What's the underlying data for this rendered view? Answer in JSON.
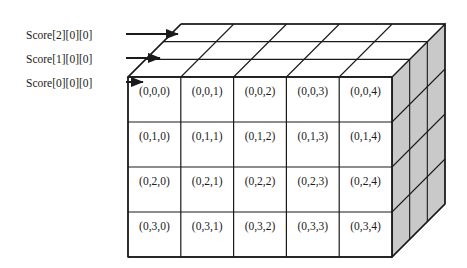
{
  "figure": {
    "colors": {
      "line": "#1a1a1a",
      "side_face_fill": "#c9c9c9",
      "top_face_fill": "#ffffff",
      "front_face_fill": "#ffffff",
      "text": "#1a1a1a",
      "background": "#ffffff"
    },
    "annotations": [
      {
        "id": "score2",
        "text": "Score[2][0][0]",
        "x": 26,
        "y": 29,
        "arrow": {
          "x1": 126,
          "y1": 34,
          "x2": 178,
          "y2": 34
        }
      },
      {
        "id": "score1",
        "text": "Score[1][0][0]",
        "x": 26,
        "y": 53,
        "arrow": {
          "x1": 126,
          "y1": 58,
          "x2": 160,
          "y2": 58
        }
      },
      {
        "id": "score0",
        "text": "Score[0][0][0]",
        "x": 26,
        "y": 77,
        "arrow": {
          "x1": 126,
          "y1": 82,
          "x2": 143,
          "y2": 82
        }
      }
    ],
    "geometry": {
      "front": {
        "left": 128,
        "top": 77,
        "width": 264,
        "height": 180,
        "cols": 5,
        "rows": 4
      },
      "depth": {
        "dx": 53,
        "dy": -53,
        "layers": 3
      }
    },
    "front_cells": [
      [
        "(0,0,0)",
        "(0,0,1)",
        "(0,0,2)",
        "(0,0,3)",
        "(0,0,4)"
      ],
      [
        "(0,1,0)",
        "(0,1,1)",
        "(0,1,2)",
        "(0,1,3)",
        "(0,1,4)"
      ],
      [
        "(0,2,0)",
        "(0,2,1)",
        "(0,2,2)",
        "(0,2,3)",
        "(0,2,4)"
      ],
      [
        "(0,3,0)",
        "(0,3,1)",
        "(0,3,2)",
        "(0,3,3)",
        "(0,3,4)"
      ]
    ]
  }
}
